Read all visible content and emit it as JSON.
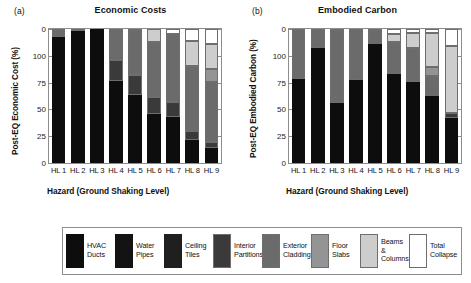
{
  "figure": {
    "legend": {
      "entries": [
        {
          "label": "HVAC\nDucts",
          "color": "#0d0d0d",
          "outlined": false
        },
        {
          "label": "Water\nPipes",
          "color": "#131313",
          "outlined": false
        },
        {
          "label": "Ceiling\nTiles",
          "color": "#1f1f1f",
          "outlined": false
        },
        {
          "label": "Interior\nPartitions",
          "color": "#3a3a3a",
          "outlined": true
        },
        {
          "label": "Exterior\nCladding",
          "color": "#6b6b6b",
          "outlined": true
        },
        {
          "label": "Floor\nSlabs",
          "color": "#949494",
          "outlined": true
        },
        {
          "label": "Beams &\nColumns",
          "color": "#cdcdcd",
          "outlined": true
        },
        {
          "label": "Total\nCollapse",
          "color": "#ffffff",
          "outlined": true
        }
      ]
    }
  },
  "chart_data": [
    {
      "type": "bar",
      "stacked": true,
      "panel": "(a)",
      "title": "Economic Costs",
      "xlabel": "Hazard (Ground Shaking Level)",
      "ylabel": "Post-EQ Economic Cost (%)",
      "categories": [
        "HL 1",
        "HL 2",
        "HL 3",
        "HL 4",
        "HL 5",
        "HL 6",
        "HL 7",
        "HL 8",
        "HL 9"
      ],
      "ylim": [
        0,
        100
      ],
      "ytick_labels": [
        "0",
        "100",
        "75",
        "50",
        "25",
        "0"
      ],
      "ytick_values": [
        100,
        100,
        75,
        50,
        25,
        0
      ],
      "grid": false,
      "legend_position": "below-figure",
      "series": [
        {
          "name": "HVAC Ducts",
          "color": "#0d0d0d",
          "values": [
            94,
            99,
            101,
            61,
            51,
            41,
            35,
            17,
            11
          ]
        },
        {
          "name": "Water Pipes",
          "color": "#131313",
          "values": [
            0,
            0,
            0,
            0,
            0,
            0,
            0,
            0,
            0
          ]
        },
        {
          "name": "Ceiling Tiles",
          "color": "#1f1f1f",
          "values": [
            0,
            0,
            0,
            0,
            0,
            0,
            0,
            0,
            0
          ]
        },
        {
          "name": "Interior Partitions",
          "color": "#3a3a3a",
          "values": [
            0,
            0,
            0,
            16,
            15,
            14,
            11,
            7,
            5
          ]
        },
        {
          "name": "Exterior Cladding",
          "color": "#6b6b6b",
          "values": [
            6,
            1,
            0,
            23,
            34,
            45,
            51,
            49,
            45
          ]
        },
        {
          "name": "Floor Slabs",
          "color": "#949494",
          "values": [
            0,
            0,
            0,
            0,
            0,
            0,
            0,
            0,
            10
          ]
        },
        {
          "name": "Beams & Columns",
          "color": "#cdcdcd",
          "values": [
            0,
            0,
            0,
            0,
            0,
            11,
            0,
            19,
            19
          ]
        },
        {
          "name": "Total Collapse",
          "color": "#ffffff",
          "values": [
            0,
            0,
            0,
            0,
            0,
            0,
            4,
            9,
            11
          ]
        }
      ]
    },
    {
      "type": "bar",
      "stacked": true,
      "panel": "(b)",
      "title": "Embodied Carbon",
      "xlabel": "Hazard (Ground Shaking Level)",
      "ylabel": "Post-EQ Embodied Carbon (%)",
      "categories": [
        "HL 1",
        "HL 2",
        "HL 3",
        "HL 4",
        "HL 5",
        "HL 6",
        "HL 7",
        "HL 8",
        "HL 9"
      ],
      "ylim": [
        0,
        100
      ],
      "ytick_labels": [
        "0",
        "100",
        "75",
        "50",
        "25",
        "0"
      ],
      "ytick_values": [
        100,
        100,
        75,
        50,
        25,
        0
      ],
      "grid": false,
      "legend_position": "below-figure",
      "series": [
        {
          "name": "HVAC Ducts",
          "color": "#0d0d0d",
          "values": [
            63,
            86,
            48,
            62,
            89,
            70,
            65,
            54,
            34
          ]
        },
        {
          "name": "Water Pipes",
          "color": "#131313",
          "values": [
            0,
            0,
            0,
            0,
            0,
            0,
            0,
            0,
            0
          ]
        },
        {
          "name": "Ceiling Tiles",
          "color": "#1f1f1f",
          "values": [
            0,
            0,
            0,
            0,
            0,
            0,
            0,
            0,
            0
          ]
        },
        {
          "name": "Interior Partitions",
          "color": "#3a3a3a",
          "values": [
            0,
            0,
            0,
            0,
            0,
            0,
            0,
            0,
            4
          ]
        },
        {
          "name": "Exterior Cladding",
          "color": "#6b6b6b",
          "values": [
            37,
            14,
            59,
            38,
            11,
            25,
            27,
            16,
            0
          ]
        },
        {
          "name": "Floor Slabs",
          "color": "#949494",
          "values": [
            0,
            0,
            0,
            0,
            0,
            0,
            0,
            7,
            0
          ]
        },
        {
          "name": "Beams & Columns",
          "color": "#cdcdcd",
          "values": [
            0,
            0,
            0,
            0,
            0,
            6,
            12,
            27,
            50
          ]
        },
        {
          "name": "Total Collapse",
          "color": "#ffffff",
          "values": [
            0,
            0,
            0,
            0,
            0,
            4,
            3,
            3,
            13
          ]
        }
      ]
    }
  ]
}
